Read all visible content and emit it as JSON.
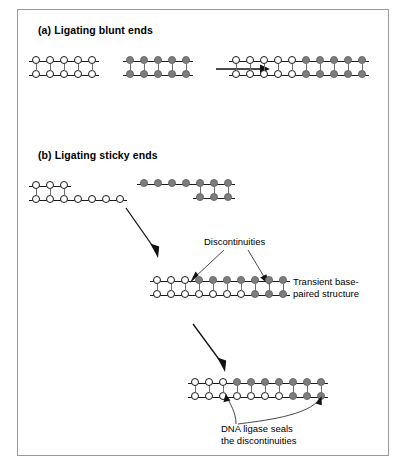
{
  "figure": {
    "panel_a": {
      "heading": "(a) Ligating blunt ends",
      "reactant_left": {
        "name": "blunt-white-fragment",
        "top_strand": [
          "open",
          "open",
          "open",
          "open",
          "open"
        ],
        "bottom_strand": [
          "open",
          "open",
          "open",
          "open",
          "open"
        ]
      },
      "reactant_right": {
        "name": "blunt-gray-fragment",
        "top_strand": [
          "filled",
          "filled",
          "filled",
          "filled",
          "filled"
        ],
        "bottom_strand": [
          "filled",
          "filled",
          "filled",
          "filled",
          "filled"
        ]
      },
      "product": {
        "name": "blunt-ligated-product",
        "top_strand": [
          "open",
          "open",
          "open",
          "open",
          "open",
          "filled",
          "filled",
          "filled",
          "filled",
          "filled"
        ],
        "bottom_strand": [
          "open",
          "open",
          "open",
          "open",
          "open",
          "filled",
          "filled",
          "filled",
          "filled",
          "filled"
        ]
      }
    },
    "panel_b": {
      "heading": "(b) Ligating sticky ends",
      "reactant_left": {
        "name": "sticky-white-fragment",
        "top_strand": [
          "open",
          "open",
          "open"
        ],
        "bottom_strand": [
          "open",
          "open",
          "open",
          "open",
          "open",
          "open",
          "open"
        ]
      },
      "reactant_right": {
        "name": "sticky-gray-fragment",
        "top_strand": [
          "filled",
          "filled",
          "filled",
          "filled",
          "filled",
          "filled",
          "filled"
        ],
        "bottom_strand": [
          "filled",
          "filled",
          "filled"
        ]
      },
      "intermediate": {
        "name": "transient-base-paired-structure",
        "top_strand": [
          "open",
          "open",
          "open",
          "filled",
          "filled",
          "filled",
          "filled",
          "filled",
          "filled",
          "filled"
        ],
        "bottom_strand": [
          "open",
          "open",
          "open",
          "open",
          "open",
          "open",
          "open",
          "filled",
          "filled",
          "filled"
        ],
        "label": "Transient base-\npaired structure",
        "callout": "Discontinuities"
      },
      "product": {
        "name": "sticky-ligated-product",
        "top_strand": [
          "open",
          "open",
          "open",
          "filled",
          "filled",
          "filled",
          "filled",
          "filled",
          "filled",
          "filled"
        ],
        "bottom_strand": [
          "open",
          "open",
          "open",
          "open",
          "open",
          "open",
          "open",
          "filled",
          "filled",
          "filled"
        ],
        "caption": "DNA ligase seals\nthe discontinuities"
      }
    },
    "colors": {
      "open_base_fill": "#ffffff",
      "open_base_stroke": "#1a1a1a",
      "filled_base": "#7d7d7d",
      "backbone": "#1a1a1a",
      "frame": "#9a9a9a"
    }
  }
}
